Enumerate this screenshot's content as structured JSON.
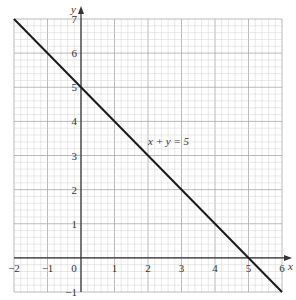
{
  "chart_data": {
    "type": "line",
    "title": "",
    "xlabel": "x",
    "ylabel": "y",
    "xlim": [
      -2,
      6
    ],
    "ylim": [
      -1,
      7
    ],
    "x_ticks": [
      "-2",
      "-1",
      "0",
      "1",
      "2",
      "3",
      "4",
      "5",
      "6"
    ],
    "y_ticks": [
      "-1",
      "1",
      "2",
      "3",
      "4",
      "5",
      "6",
      "7"
    ],
    "grid": true,
    "minor_divisions_per_unit": 5,
    "series": [
      {
        "name": "x + y = 5",
        "x": [
          -2,
          6
        ],
        "y": [
          7,
          -1
        ]
      }
    ],
    "annotations": [
      {
        "text": "x + y = 5",
        "x": 2.0,
        "y": 3.3
      }
    ]
  },
  "labels": {
    "x_axis": "x",
    "y_axis": "y",
    "line_label": "x + y = 5",
    "origin": "0"
  },
  "colors": {
    "grid_minor": "#d0d0d0",
    "grid_major": "#a8a8a8",
    "axis": "#333333",
    "line": "#1a1a1a"
  }
}
